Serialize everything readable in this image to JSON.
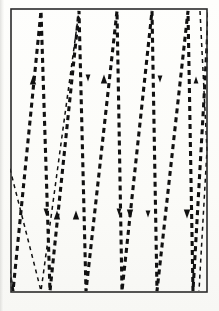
{
  "figure": {
    "kind": "line-diagram",
    "background_color": "#fdfdfb",
    "ink_color": "#1a1a1a",
    "frame": {
      "label": "rectangular boundary",
      "x": 11,
      "y": 9,
      "width": 196,
      "height": 283,
      "stroke_color": "#2b2b2b",
      "stroke_width": 1.6
    },
    "stroke": {
      "dash_pattern": "5 4",
      "dash_pattern_thin": "4 4",
      "width_thick": 3.1,
      "width_thin": 1.5,
      "color": "#111111"
    },
    "top_edge_y": 11,
    "bottom_edge_y": 291,
    "top_vertices_x": [
      41,
      79,
      117,
      152,
      188
    ],
    "bottom_vertices_x": [
      13,
      50,
      86,
      122,
      157,
      193
    ],
    "zigzag_points": [
      [
        -4,
        207
      ],
      [
        13,
        291
      ],
      [
        41,
        11
      ],
      [
        50,
        291
      ],
      [
        79,
        11
      ],
      [
        86,
        291
      ],
      [
        117,
        11
      ],
      [
        122,
        291
      ],
      [
        152,
        11
      ],
      [
        157,
        291
      ],
      [
        188,
        11
      ],
      [
        193,
        291
      ],
      [
        209,
        11
      ]
    ],
    "secondary_points": [
      [
        8,
        161
      ],
      [
        41,
        291
      ],
      [
        41,
        291
      ],
      [
        79,
        11
      ]
    ],
    "tail_points": [
      [
        200,
        11
      ],
      [
        207,
        150
      ],
      [
        207,
        150
      ],
      [
        199,
        291
      ]
    ],
    "arrows": [
      {
        "x": 33,
        "y": 80,
        "direction": "up",
        "size": "large"
      },
      {
        "x": 88,
        "y": 78,
        "direction": "down",
        "size": "small"
      },
      {
        "x": 104,
        "y": 79,
        "direction": "up",
        "size": "large"
      },
      {
        "x": 160,
        "y": 79,
        "direction": "down",
        "size": "small"
      },
      {
        "x": 196,
        "y": 80,
        "direction": "up",
        "size": "small"
      },
      {
        "x": 46,
        "y": 212,
        "direction": "down",
        "size": "small"
      },
      {
        "x": 57,
        "y": 215,
        "direction": "up",
        "size": "large"
      },
      {
        "x": 76,
        "y": 215,
        "direction": "up",
        "size": "large"
      },
      {
        "x": 119,
        "y": 212,
        "direction": "down",
        "size": "small"
      },
      {
        "x": 130,
        "y": 214,
        "direction": "down",
        "size": "large"
      },
      {
        "x": 148,
        "y": 214,
        "direction": "down",
        "size": "small"
      },
      {
        "x": 187,
        "y": 214,
        "direction": "down",
        "size": "large"
      }
    ]
  }
}
